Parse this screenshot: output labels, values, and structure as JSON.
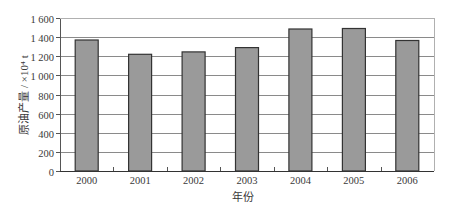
{
  "chart_data": {
    "type": "bar",
    "title": "",
    "xlabel": "年份",
    "ylabel": "原油产量 / ×10⁴ t",
    "categories": [
      "2000",
      "2001",
      "2002",
      "2003",
      "2004",
      "2005",
      "2006"
    ],
    "values": [
      1370,
      1220,
      1245,
      1290,
      1485,
      1490,
      1365
    ],
    "ylim": [
      0,
      1600
    ],
    "yticks": [
      0,
      200,
      400,
      600,
      800,
      1000,
      1200,
      1400,
      1600
    ],
    "ytick_labels": [
      "0",
      "200",
      "400",
      "600",
      "800",
      "1 000",
      "1 200",
      "1 400",
      "1 600"
    ],
    "grid": true,
    "legend": null,
    "colors": {
      "bar_fill": "#9a9a9a",
      "bar_stroke": "#333333",
      "grid": "#8a8a8a",
      "axis": "#555555"
    }
  }
}
